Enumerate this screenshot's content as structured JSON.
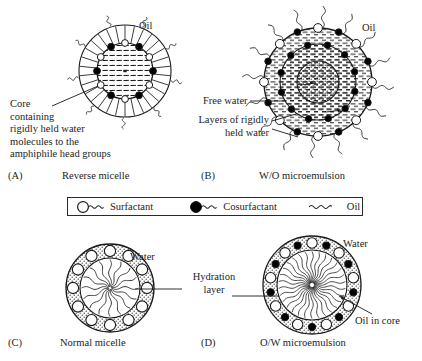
{
  "figure": {
    "background": "#ffffff",
    "ink": "#1a1a1a"
  },
  "panels": [
    {
      "id": "A",
      "tag": "(A)",
      "caption": "Reverse micelle",
      "outer_label": "Oil",
      "annotation": "Core\ncontaining\nrigidly held water\nmolecules to the\namphiphile head groups"
    },
    {
      "id": "B",
      "tag": "(B)",
      "caption": "W/O microemulsion",
      "outer_label": "Oil",
      "annotation_free_water": "Free water",
      "annotation_layers": "Layers of rigidly\nheld water"
    },
    {
      "id": "C",
      "tag": "(C)",
      "caption": "Normal micelle",
      "outer_label": "Water",
      "annotation_hydration": "Hydration\nlayer"
    },
    {
      "id": "D",
      "tag": "(D)",
      "caption": "O/W microemulsion",
      "outer_label": "Water",
      "annotation_core": "Oil in core"
    }
  ],
  "legend": {
    "items": [
      {
        "key": "surfactant",
        "label": "Surfactant",
        "head": "open-circle",
        "head_fill": "#ffffff"
      },
      {
        "key": "cosurfactant",
        "label": "Cosurfactant",
        "head": "filled-circle",
        "head_fill": "#000000"
      },
      {
        "key": "oil",
        "label": "Oil",
        "head": "none",
        "head_fill": "none"
      }
    ]
  }
}
